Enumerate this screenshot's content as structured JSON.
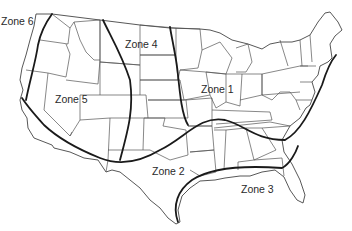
{
  "map": {
    "title": "",
    "subject": "Contiguous United States divided into zones",
    "zones": [
      {
        "id": "zone-6",
        "label": "Zone 6",
        "x": 1,
        "y": 15
      },
      {
        "id": "zone-4",
        "label": "Zone 4",
        "x": 125,
        "y": 38
      },
      {
        "id": "zone-5",
        "label": "Zone 5",
        "x": 55,
        "y": 93
      },
      {
        "id": "zone-1",
        "label": "Zone 1",
        "x": 201,
        "y": 83
      },
      {
        "id": "zone-2",
        "label": "Zone 2",
        "x": 152,
        "y": 165
      },
      {
        "id": "zone-3",
        "label": "Zone 3",
        "x": 241,
        "y": 183
      }
    ],
    "colors": {
      "background": "#ffffff",
      "state_borders": "#555555",
      "zone_boundaries": "#1a1a1a",
      "text": "#2a2a2a"
    }
  }
}
